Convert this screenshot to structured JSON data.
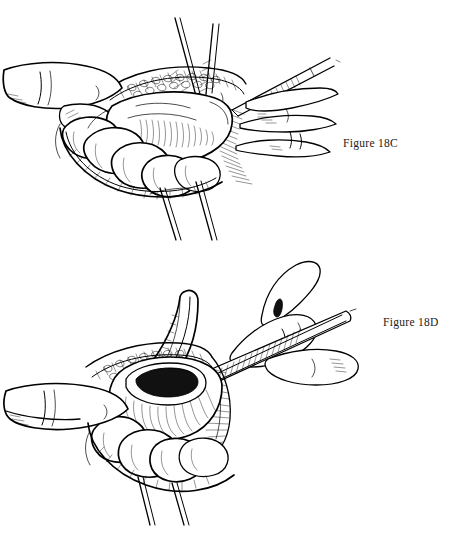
{
  "plate": {
    "title": "Surgical technique illustration plate",
    "medium": "pen-and-ink line drawing",
    "background_color": "#ffffff",
    "ink_color": "#000000",
    "panel_count": 2
  },
  "figures": [
    {
      "id": "18C",
      "caption": "Figure 18C",
      "caption_position": {
        "x": 343,
        "y": 137
      },
      "description": "Open abdominal wound held apart by retractors and a gloved hand; loops of bowel exposed with forceps grasping the wound edge",
      "elements": [
        {
          "name": "retractor-blade-upper-left",
          "kind": "instrument"
        },
        {
          "name": "retractor-blade-upper-right",
          "kind": "instrument"
        },
        {
          "name": "forceps-clamp",
          "kind": "instrument"
        },
        {
          "name": "surgeon-thumb-left",
          "kind": "anatomy"
        },
        {
          "name": "surgeon-fingers-right",
          "kind": "anatomy"
        },
        {
          "name": "bowel-loops",
          "kind": "anatomy"
        },
        {
          "name": "wound-edge-tissue",
          "kind": "anatomy"
        },
        {
          "name": "retractor-shaft-lower",
          "kind": "instrument"
        }
      ]
    },
    {
      "id": "18D",
      "caption": "Figure 18D",
      "caption_position": {
        "x": 383,
        "y": 316
      },
      "description": "Matured stoma with open lumen being incised by a scalpel held in the surgeon's hand; curved retractor holds the wound and bowel loops lie below",
      "elements": [
        {
          "name": "scalpel",
          "kind": "instrument"
        },
        {
          "name": "surgeon-hand-right",
          "kind": "anatomy"
        },
        {
          "name": "curved-retractor",
          "kind": "instrument"
        },
        {
          "name": "stoma-lumen",
          "kind": "anatomy"
        },
        {
          "name": "stoma-body",
          "kind": "anatomy"
        },
        {
          "name": "bowel-loops",
          "kind": "anatomy"
        },
        {
          "name": "finger-retracting-left",
          "kind": "anatomy"
        },
        {
          "name": "wound-edge-tissue",
          "kind": "anatomy"
        },
        {
          "name": "retractor-shaft-lower",
          "kind": "instrument"
        }
      ]
    }
  ]
}
